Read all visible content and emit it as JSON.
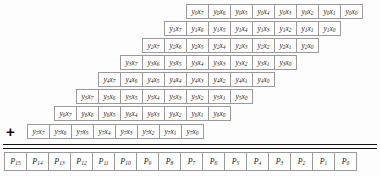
{
  "diagram": {
    "operator_symbol": "+",
    "cell_width_px": 23,
    "row_height_px": 15,
    "colors": {
      "background": "#fdfdfd",
      "cell_border": "#9a9a9a",
      "cell_fill": "#ffffff",
      "rule": "#111111",
      "text": "#1a1a1a"
    },
    "partial_product_rows": [
      {
        "index": 0,
        "left_px": 186,
        "top_px": 4,
        "cells": [
          {
            "base": "y",
            "sub": "0",
            "base2": "x",
            "sub2": "7"
          },
          {
            "base": "y",
            "sub": "0",
            "base2": "x",
            "sub2": "6"
          },
          {
            "base": "y",
            "sub": "0",
            "base2": "x",
            "sub2": "5"
          },
          {
            "base": "y",
            "sub": "0",
            "base2": "x",
            "sub2": "4"
          },
          {
            "base": "y",
            "sub": "0",
            "base2": "x",
            "sub2": "3"
          },
          {
            "base": "y",
            "sub": "0",
            "base2": "x",
            "sub2": "2"
          },
          {
            "base": "y",
            "sub": "0",
            "base2": "x",
            "sub2": "1"
          },
          {
            "base": "y",
            "sub": "0",
            "base2": "x",
            "sub2": "0"
          }
        ]
      },
      {
        "index": 1,
        "left_px": 164,
        "top_px": 21,
        "cells": [
          {
            "base": "y",
            "sub": "1",
            "base2": "x",
            "sub2": "7"
          },
          {
            "base": "y",
            "sub": "1",
            "base2": "x",
            "sub2": "6"
          },
          {
            "base": "y",
            "sub": "1",
            "base2": "x",
            "sub2": "5"
          },
          {
            "base": "y",
            "sub": "1",
            "base2": "x",
            "sub2": "4"
          },
          {
            "base": "y",
            "sub": "1",
            "base2": "x",
            "sub2": "3"
          },
          {
            "base": "y",
            "sub": "1",
            "base2": "x",
            "sub2": "2"
          },
          {
            "base": "y",
            "sub": "1",
            "base2": "x",
            "sub2": "1"
          },
          {
            "base": "y",
            "sub": "1",
            "base2": "x",
            "sub2": "0"
          }
        ]
      },
      {
        "index": 2,
        "left_px": 142,
        "top_px": 38,
        "cells": [
          {
            "base": "y",
            "sub": "2",
            "base2": "x",
            "sub2": "7"
          },
          {
            "base": "y",
            "sub": "2",
            "base2": "x",
            "sub2": "6"
          },
          {
            "base": "y",
            "sub": "2",
            "base2": "x",
            "sub2": "5"
          },
          {
            "base": "y",
            "sub": "2",
            "base2": "x",
            "sub2": "4"
          },
          {
            "base": "y",
            "sub": "2",
            "base2": "x",
            "sub2": "3"
          },
          {
            "base": "y",
            "sub": "2",
            "base2": "x",
            "sub2": "2"
          },
          {
            "base": "y",
            "sub": "2",
            "base2": "x",
            "sub2": "1"
          },
          {
            "base": "y",
            "sub": "2",
            "base2": "x",
            "sub2": "0"
          }
        ]
      },
      {
        "index": 3,
        "left_px": 120,
        "top_px": 55,
        "cells": [
          {
            "base": "y",
            "sub": "3",
            "base2": "x",
            "sub2": "7"
          },
          {
            "base": "y",
            "sub": "3",
            "base2": "x",
            "sub2": "6"
          },
          {
            "base": "y",
            "sub": "3",
            "base2": "x",
            "sub2": "5"
          },
          {
            "base": "y",
            "sub": "3",
            "base2": "x",
            "sub2": "4"
          },
          {
            "base": "y",
            "sub": "3",
            "base2": "x",
            "sub2": "3"
          },
          {
            "base": "y",
            "sub": "3",
            "base2": "x",
            "sub2": "2"
          },
          {
            "base": "y",
            "sub": "3",
            "base2": "x",
            "sub2": "1"
          },
          {
            "base": "y",
            "sub": "3",
            "base2": "x",
            "sub2": "0"
          }
        ]
      },
      {
        "index": 4,
        "left_px": 98,
        "top_px": 72,
        "cells": [
          {
            "base": "y",
            "sub": "4",
            "base2": "x",
            "sub2": "7"
          },
          {
            "base": "y",
            "sub": "4",
            "base2": "x",
            "sub2": "6"
          },
          {
            "base": "y",
            "sub": "4",
            "base2": "x",
            "sub2": "5"
          },
          {
            "base": "y",
            "sub": "4",
            "base2": "x",
            "sub2": "4"
          },
          {
            "base": "y",
            "sub": "4",
            "base2": "x",
            "sub2": "3"
          },
          {
            "base": "y",
            "sub": "4",
            "base2": "x",
            "sub2": "2"
          },
          {
            "base": "y",
            "sub": "4",
            "base2": "x",
            "sub2": "1"
          },
          {
            "base": "y",
            "sub": "4",
            "base2": "x",
            "sub2": "0"
          }
        ]
      },
      {
        "index": 5,
        "left_px": 76,
        "top_px": 89,
        "cells": [
          {
            "base": "y",
            "sub": "5",
            "base2": "x",
            "sub2": "7"
          },
          {
            "base": "y",
            "sub": "5",
            "base2": "x",
            "sub2": "6"
          },
          {
            "base": "y",
            "sub": "5",
            "base2": "x",
            "sub2": "5"
          },
          {
            "base": "y",
            "sub": "5",
            "base2": "x",
            "sub2": "4"
          },
          {
            "base": "y",
            "sub": "5",
            "base2": "x",
            "sub2": "3"
          },
          {
            "base": "y",
            "sub": "5",
            "base2": "x",
            "sub2": "2"
          },
          {
            "base": "y",
            "sub": "5",
            "base2": "x",
            "sub2": "1"
          },
          {
            "base": "y",
            "sub": "5",
            "base2": "x",
            "sub2": "0"
          }
        ]
      },
      {
        "index": 6,
        "left_px": 54,
        "top_px": 106,
        "cells": [
          {
            "base": "y",
            "sub": "6",
            "base2": "x",
            "sub2": "7"
          },
          {
            "base": "y",
            "sub": "6",
            "base2": "x",
            "sub2": "6"
          },
          {
            "base": "y",
            "sub": "6",
            "base2": "x",
            "sub2": "5"
          },
          {
            "base": "y",
            "sub": "6",
            "base2": "x",
            "sub2": "4"
          },
          {
            "base": "y",
            "sub": "6",
            "base2": "x",
            "sub2": "3"
          },
          {
            "base": "y",
            "sub": "6",
            "base2": "x",
            "sub2": "2"
          },
          {
            "base": "y",
            "sub": "6",
            "base2": "x",
            "sub2": "1"
          },
          {
            "base": "y",
            "sub": "6",
            "base2": "x",
            "sub2": "0"
          }
        ]
      },
      {
        "index": 7,
        "left_px": 27,
        "top_px": 124,
        "cells": [
          {
            "base": "y",
            "sub": "7",
            "base2": "x",
            "sub2": "7"
          },
          {
            "base": "y",
            "sub": "7",
            "base2": "x",
            "sub2": "6"
          },
          {
            "base": "y",
            "sub": "7",
            "base2": "x",
            "sub2": "5"
          },
          {
            "base": "y",
            "sub": "7",
            "base2": "x",
            "sub2": "4"
          },
          {
            "base": "y",
            "sub": "7",
            "base2": "x",
            "sub2": "3"
          },
          {
            "base": "y",
            "sub": "7",
            "base2": "x",
            "sub2": "2"
          },
          {
            "base": "y",
            "sub": "7",
            "base2": "x",
            "sub2": "1"
          },
          {
            "base": "y",
            "sub": "7",
            "base2": "x",
            "sub2": "0"
          }
        ]
      }
    ],
    "product_row": {
      "cells": [
        {
          "base": "P",
          "sub": "15"
        },
        {
          "base": "P",
          "sub": "14"
        },
        {
          "base": "P",
          "sub": "13"
        },
        {
          "base": "P",
          "sub": "12"
        },
        {
          "base": "P",
          "sub": "11"
        },
        {
          "base": "P",
          "sub": "10"
        },
        {
          "base": "P",
          "sub": "9"
        },
        {
          "base": "P",
          "sub": "8"
        },
        {
          "base": "P",
          "sub": "7"
        },
        {
          "base": "P",
          "sub": "6"
        },
        {
          "base": "P",
          "sub": "5"
        },
        {
          "base": "P",
          "sub": "4"
        },
        {
          "base": "P",
          "sub": "3"
        },
        {
          "base": "P",
          "sub": "2"
        },
        {
          "base": "P",
          "sub": "1"
        },
        {
          "base": "P",
          "sub": "0"
        }
      ]
    }
  }
}
